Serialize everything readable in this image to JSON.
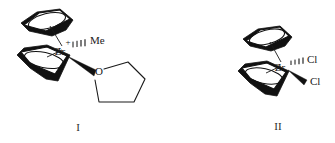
{
  "figure": {
    "kind": "chemical-structure-scheme",
    "background_color": "#ffffff",
    "ink_color": "#111111",
    "structures": [
      {
        "id": "structure-I",
        "roman_label": "I",
        "metal": "Zr",
        "charge": "+",
        "ligands": [
          {
            "name": "cyclopentadienyl",
            "display": "",
            "position": "upper-left"
          },
          {
            "name": "cyclopentadienyl",
            "display": "",
            "position": "lower-left"
          },
          {
            "name": "methyl",
            "display": "Me",
            "bond": "hashed"
          },
          {
            "name": "tetrahydrofuran-oxygen",
            "display": "O",
            "bond": "bold-wedge"
          }
        ]
      },
      {
        "id": "structure-II",
        "roman_label": "II",
        "metal": "Zr",
        "charge": "",
        "ligands": [
          {
            "name": "cyclopentadienyl",
            "display": "",
            "position": "upper-left"
          },
          {
            "name": "cyclopentadienyl",
            "display": "",
            "position": "lower-left"
          },
          {
            "name": "chloride-upper",
            "display": "Cl",
            "bond": "hashed"
          },
          {
            "name": "chloride-lower",
            "display": "Cl",
            "bond": "bold-wedge"
          }
        ]
      }
    ]
  },
  "structure_I": {
    "metal_label": "Zr",
    "charge_label": "+",
    "methyl_label": "Me",
    "oxygen_label": "O",
    "roman": "I"
  },
  "structure_II": {
    "metal_label": "Zr",
    "chloride_label_upper": "Cl",
    "chloride_label_lower": "Cl",
    "roman": "II"
  }
}
